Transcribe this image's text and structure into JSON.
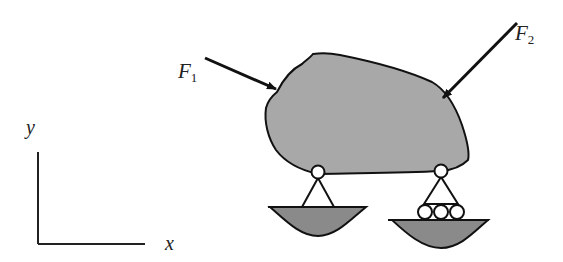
{
  "diagram": {
    "forces": [
      {
        "name": "F",
        "subscript": "1"
      },
      {
        "name": "F",
        "subscript": "2"
      }
    ],
    "axes": {
      "x_label": "x",
      "y_label": "y"
    },
    "supports": [
      {
        "type": "pin",
        "position": "left"
      },
      {
        "type": "roller",
        "position": "right"
      }
    ],
    "colors": {
      "body_fill": "#a8a8a8",
      "ground_fill": "#8a8a8a",
      "stroke": "#111111",
      "background": "#ffffff"
    }
  }
}
